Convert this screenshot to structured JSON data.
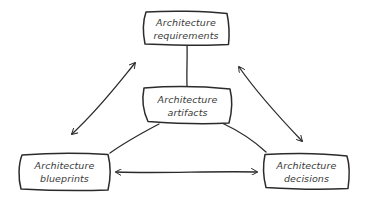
{
  "diagram": {
    "style": "hand-drawn sketch",
    "colors": {
      "stroke": "#2b2b2b",
      "text": "#3a3a3a",
      "background": "#ffffff"
    },
    "nodes": [
      {
        "id": "requirements",
        "line1": "Architecture",
        "line2": "requirements",
        "position": "top"
      },
      {
        "id": "artifacts",
        "line1": "Architecture",
        "line2": "artifacts",
        "position": "center"
      },
      {
        "id": "blueprints",
        "line1": "Architecture",
        "line2": "blueprints",
        "position": "bottom-left"
      },
      {
        "id": "decisions",
        "line1": "Architecture",
        "line2": "decisions",
        "position": "bottom-right"
      }
    ],
    "edges": [
      {
        "from": "requirements",
        "to": "artifacts",
        "type": "line"
      },
      {
        "from": "artifacts",
        "to": "blueprints",
        "type": "line"
      },
      {
        "from": "artifacts",
        "to": "decisions",
        "type": "line"
      },
      {
        "from": "requirements",
        "to": "blueprints",
        "type": "double-arrow"
      },
      {
        "from": "requirements",
        "to": "decisions",
        "type": "double-arrow"
      },
      {
        "from": "blueprints",
        "to": "decisions",
        "type": "double-arrow"
      }
    ]
  }
}
